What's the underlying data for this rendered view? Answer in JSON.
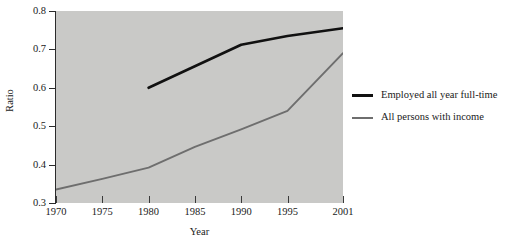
{
  "chart_data": {
    "type": "line",
    "title": "",
    "xlabel": "Year",
    "ylabel": "Ratio",
    "x": [
      1970,
      1975,
      1980,
      1985,
      1990,
      1995,
      2001
    ],
    "xtick_labels": [
      "1970",
      "1975",
      "1980",
      "1985",
      "1990",
      "1995",
      "2001"
    ],
    "ytick_labels": [
      "0.3",
      "0.4",
      "0.5",
      "0.6",
      "0.7",
      "0.8"
    ],
    "ytick_values": [
      0.3,
      0.4,
      0.5,
      0.6,
      0.7,
      0.8
    ],
    "xlim": [
      1970,
      2001
    ],
    "ylim": [
      0.3,
      0.8
    ],
    "grid": false,
    "legend_position": "right-outside",
    "plot_background": "#c9c9c7",
    "series": [
      {
        "name": "Employed all year full-time",
        "color": "#111111",
        "line_width": 2.6,
        "x": [
          1980,
          1985,
          1990,
          1995,
          2001
        ],
        "values": [
          0.6,
          0.656,
          0.712,
          0.735,
          0.755
        ]
      },
      {
        "name": "All persons with income",
        "color": "#6e6e6e",
        "line_width": 1.9,
        "x": [
          1970,
          1975,
          1980,
          1985,
          1990,
          1995,
          2001
        ],
        "values": [
          0.335,
          0.363,
          0.392,
          0.446,
          0.492,
          0.54,
          0.69
        ]
      }
    ]
  },
  "legend": {
    "items": [
      {
        "label": "Employed all year full-time",
        "color": "#111111"
      },
      {
        "label": "All persons with income",
        "color": "#6e6e6e"
      }
    ]
  },
  "axes": {
    "x_title": "Year",
    "y_title": "Ratio"
  }
}
